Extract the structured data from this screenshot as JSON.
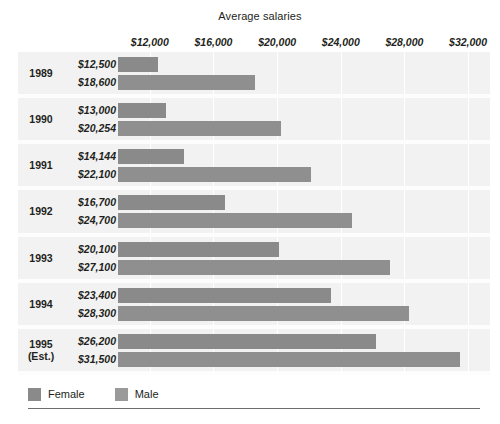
{
  "chart_data": {
    "type": "bar",
    "orientation": "horizontal",
    "title": "Average salaries",
    "xlabel": "",
    "ylabel": "",
    "grid": true,
    "legend_position": "bottom-left",
    "xlim": [
      10000,
      33000
    ],
    "xticks": [
      12000,
      16000,
      20000,
      24000,
      28000,
      32000
    ],
    "xtick_labels": [
      "$12,000",
      "$16,000",
      "$20,000",
      "$24,000",
      "$28,000",
      "$32,000"
    ],
    "categories": [
      "1989",
      "1990",
      "1991",
      "1992",
      "1993",
      "1994",
      "1995 (Est.)"
    ],
    "series": [
      {
        "name": "Female",
        "color": "#8a8a8a",
        "values": [
          12500,
          13000,
          14144,
          16700,
          20100,
          23400,
          26200
        ],
        "labels": [
          "$12,500",
          "$13,000",
          "$14,144",
          "$16,700",
          "$20,100",
          "$23,400",
          "$26,200"
        ]
      },
      {
        "name": "Male",
        "color": "#8f8f8f",
        "values": [
          18600,
          20254,
          22100,
          24700,
          27100,
          28300,
          31500
        ],
        "labels": [
          "$18,600",
          "$20,254",
          "$22,100",
          "$24,700",
          "$27,100",
          "$28,300",
          "$31,500"
        ]
      }
    ]
  },
  "groups": [
    {
      "year_line1": "1989",
      "year_line2": "",
      "female_label": "$12,500",
      "male_label": "$18,600"
    },
    {
      "year_line1": "1990",
      "year_line2": "",
      "female_label": "$13,000",
      "male_label": "$20,254"
    },
    {
      "year_line1": "1991",
      "year_line2": "",
      "female_label": "$14,144",
      "male_label": "$22,100"
    },
    {
      "year_line1": "1992",
      "year_line2": "",
      "female_label": "$16,700",
      "male_label": "$24,700"
    },
    {
      "year_line1": "1993",
      "year_line2": "",
      "female_label": "$20,100",
      "male_label": "$27,100"
    },
    {
      "year_line1": "1994",
      "year_line2": "",
      "female_label": "$23,400",
      "male_label": "$28,300"
    },
    {
      "year_line1": "1995",
      "year_line2": "(Est.)",
      "female_label": "$26,200",
      "male_label": "$31,500"
    }
  ],
  "legend": {
    "items": [
      {
        "label": "Female",
        "color": "#8a8a8a"
      },
      {
        "label": "Male",
        "color": "#9a9a9a"
      }
    ]
  }
}
